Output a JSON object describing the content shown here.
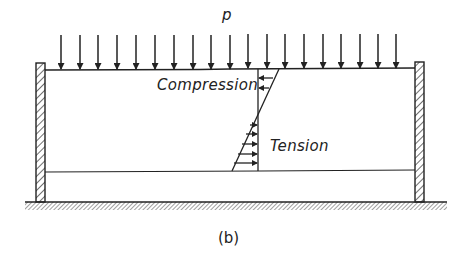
{
  "figure": {
    "caption": "(b)",
    "load_label": "p",
    "compression_label": "Compression",
    "tension_label": "Tension",
    "line_color": "#222222",
    "load_arrows": {
      "count": 19,
      "x_positions": [
        61,
        80,
        98,
        117,
        136,
        155,
        174,
        193,
        211,
        230,
        248,
        267,
        285,
        304,
        323,
        341,
        360,
        378,
        396
      ],
      "direction": "down"
    },
    "stress_diagram": {
      "compression_arrows": 2,
      "tension_arrows": 5,
      "compression_direction": "left",
      "tension_direction": "right"
    }
  }
}
